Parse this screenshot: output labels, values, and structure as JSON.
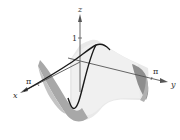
{
  "figure": {
    "type": "3d-surface-plot",
    "axes": {
      "x": {
        "label": "x",
        "tick_label": "π"
      },
      "y": {
        "label": "y",
        "tick_label": "π"
      },
      "z": {
        "label": "z",
        "tick_label": "1"
      }
    },
    "colors": {
      "surface_light": "#e6e6e6",
      "surface_mid": "#c8c8c8",
      "surface_dark": "#9a9a9a",
      "curve": "#1a1a1a",
      "axis": "#555555"
    }
  }
}
